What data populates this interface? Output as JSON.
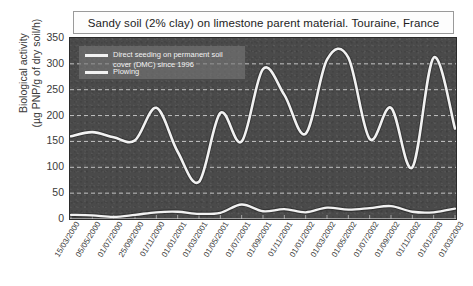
{
  "title": "Sandy soil (2% clay) on limestone parent material. Touraine, France",
  "legend": {
    "series1": "Direct seeding on permanent soil cover (DMC) since 1996",
    "series2": "Plowing"
  },
  "axis": {
    "ylabel_line1": "Biological activity",
    "ylabel_line2": "(µg PNP/g of dry soil/h)"
  },
  "chart_data": {
    "type": "line",
    "title": "Sandy soil (2% clay) on limestone parent material. Touraine, France",
    "xlabel": "",
    "ylabel": "Biological activity (µg PNP/g of dry soil/h)",
    "ylim": [
      0,
      350
    ],
    "yticks": [
      0,
      50,
      100,
      150,
      200,
      250,
      300,
      350
    ],
    "grid": "horizontal-dashed",
    "legend_position": "top-left-inside",
    "categories": [
      "15/03/2000",
      "05/05/2000",
      "01/07/2000",
      "25/09/2000",
      "01/11/2000",
      "01/01/2001",
      "01/03/2001",
      "01/05/2001",
      "01/07/2001",
      "01/09/2001",
      "01/11/2001",
      "01/01/2002",
      "01/03/2002",
      "01/05/2002",
      "01/07/2002",
      "01/09/2002",
      "01/11/2002",
      "01/01/2003",
      "01/03/2003"
    ],
    "series": [
      {
        "name": "Direct seeding on permanent soil cover (DMC) since 1996",
        "color": "#f2f2f2",
        "values": [
          160,
          168,
          158,
          152,
          215,
          130,
          72,
          205,
          150,
          290,
          240,
          165,
          308,
          312,
          155,
          215,
          100,
          312,
          175
        ]
      },
      {
        "name": "Plowing",
        "color": "#f2f2f2",
        "values": [
          8,
          7,
          4,
          8,
          13,
          14,
          10,
          12,
          28,
          15,
          19,
          13,
          22,
          18,
          21,
          25,
          14,
          13,
          20
        ]
      }
    ]
  }
}
